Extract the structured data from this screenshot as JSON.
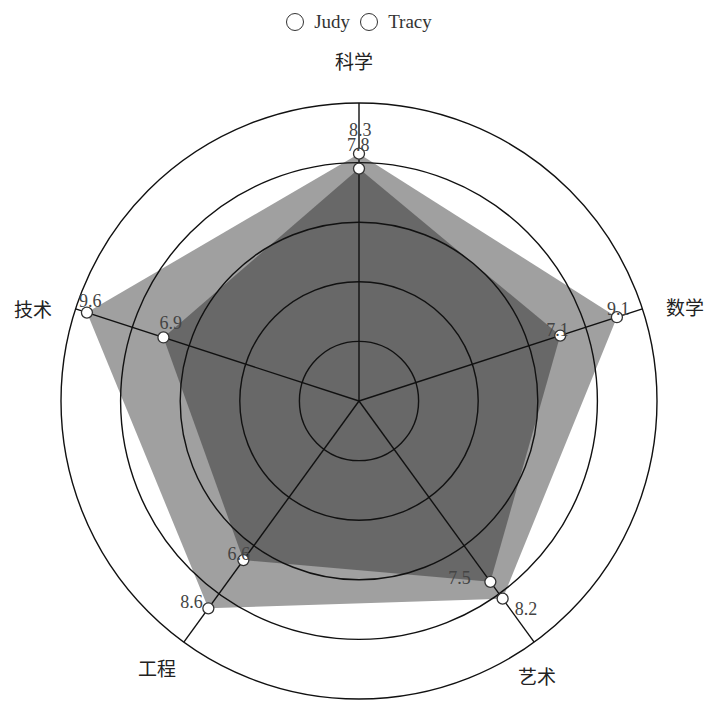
{
  "chart_data": {
    "type": "radar",
    "title": "",
    "indicators": [
      {
        "name": "科学",
        "max": 10
      },
      {
        "name": "数学",
        "max": 10
      },
      {
        "name": "艺术",
        "max": 10
      },
      {
        "name": "工程",
        "max": 10
      },
      {
        "name": "技术",
        "max": 10
      }
    ],
    "series": [
      {
        "name": "Judy",
        "values": [
          7.8,
          7.1,
          7.5,
          6.6,
          6.9
        ],
        "color": "#555555",
        "opacity": 0.75
      },
      {
        "name": "Tracy",
        "values": [
          8.3,
          9.1,
          8.2,
          8.6,
          9.6
        ],
        "color": "#a0a0a0",
        "opacity": 1.0
      }
    ],
    "rings": [
      2,
      4,
      6,
      8,
      10
    ],
    "legend": {
      "position": "top-center",
      "entries": [
        "Judy",
        "Tracy"
      ]
    },
    "data_labels": true,
    "shape": "circle"
  },
  "legend": {
    "items": [
      {
        "label": "Judy"
      },
      {
        "label": "Tracy"
      }
    ]
  },
  "colors": {
    "tracy_fill": "#a0a0a0",
    "judy_fill": "#555555",
    "grid_line": "#111111",
    "marker_fill": "#ffffff"
  }
}
